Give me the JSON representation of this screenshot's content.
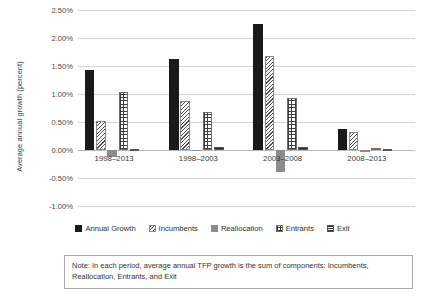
{
  "chart_data": {
    "type": "bar",
    "title": "",
    "subtitle": "",
    "xlabel": "",
    "ylabel": "Average annual growth (percent)",
    "ylim": [
      -1.0,
      2.5
    ],
    "ytick_values": [
      2.5,
      2.0,
      1.5,
      1.0,
      0.5,
      0.0,
      -0.5,
      -1.0
    ],
    "ytick_labels": [
      "2.50%",
      "2.00%",
      "1.50%",
      "1.00%",
      "0.50%",
      "0.00%",
      "-0.50%",
      "-1.00%"
    ],
    "grid": true,
    "legend_position": "bottom",
    "categories": [
      "1998–2013",
      "1998–2003",
      "2003–2008",
      "2008–2013"
    ],
    "series": [
      {
        "name": "Annual Growth",
        "pattern": "solid-black",
        "values": [
          1.43,
          1.63,
          2.25,
          0.37
        ]
      },
      {
        "name": "Incumbents",
        "pattern": "diagonal-hatch",
        "values": [
          0.52,
          0.88,
          1.68,
          0.33
        ]
      },
      {
        "name": "Reallocation",
        "pattern": "solid-gray",
        "values": [
          -0.13,
          -0.02,
          -0.4,
          -0.04
        ]
      },
      {
        "name": "Entrants",
        "pattern": "cross-hatch",
        "values": [
          1.03,
          0.67,
          0.92,
          0.04
        ]
      },
      {
        "name": "Exit",
        "pattern": "horizontal-hatch",
        "values": [
          0.02,
          0.05,
          0.05,
          0.01
        ]
      }
    ],
    "note": "Note: In each period, average annual TFP growth is the sum of components: Incumbents, Reallocation, Entrants, and Exit"
  },
  "colors": {
    "annual_growth": "#1a1a1a",
    "incumbents": "#4d4d4d",
    "reallocation": "#8c8c8c",
    "entrants": "#3d3d3d",
    "exit": "#2b2b2b",
    "gridline": "#d4d4d4",
    "text": "#3b3b3b",
    "note_border": "#a9a9a9"
  },
  "note": {
    "text": "Note: In each period, average annual TFP growth is the sum of components: Incumbents, Reallocation, Entrants, and Exit"
  }
}
